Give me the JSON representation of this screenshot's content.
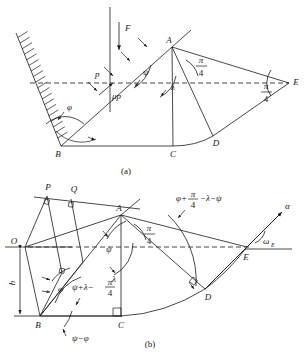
{
  "figure": {
    "title_note": "Two-panel geometric slip-line / wedge mechanism diagram",
    "captions": {
      "a": "(a)",
      "b": "(b)"
    }
  },
  "panel_a": {
    "points": [
      {
        "name": "A",
        "label": "A",
        "x": 172,
        "y": 47
      },
      {
        "name": "B",
        "label": "B",
        "x": 61,
        "y": 146
      },
      {
        "name": "C",
        "label": "C",
        "x": 173,
        "y": 146
      },
      {
        "name": "D",
        "label": "D",
        "x": 213,
        "y": 136
      },
      {
        "name": "E",
        "label": "E",
        "x": 289,
        "y": 83
      }
    ],
    "labels": {
      "force": "F",
      "pressure": "p",
      "friction": "μp",
      "wall_angle": "φ",
      "psi_angle": "ψ",
      "lambda_angle": "λ",
      "pi_over_4_num": "π",
      "pi_over_4_den": "4"
    }
  },
  "panel_b": {
    "points": [
      {
        "name": "P",
        "label": "P",
        "x": 48,
        "y": 191
      },
      {
        "name": "Q",
        "label": "Q",
        "x": 73,
        "y": 193
      },
      {
        "name": "O",
        "label": "O",
        "x": 13,
        "y": 244
      },
      {
        "name": "A",
        "label": "A",
        "x": 121,
        "y": 215
      },
      {
        "name": "B",
        "label": "B",
        "x": 40,
        "y": 318
      },
      {
        "name": "C",
        "label": "C",
        "x": 120,
        "y": 318
      },
      {
        "name": "D",
        "label": "D",
        "x": 205,
        "y": 291
      },
      {
        "name": "E",
        "label": "E",
        "x": 245,
        "y": 254
      }
    ],
    "labels": {
      "height": "h",
      "phi": "φ",
      "psi": "ψ",
      "lambda": "λ",
      "alpha": "α",
      "omega_E_base": "ω",
      "omega_E_sub": "E",
      "pi_over_4_num": "π",
      "pi_over_4_den": "4",
      "expr_left_a": "ψ+λ−",
      "expr_left_num": "π",
      "expr_left_den": "4",
      "expr_bottom": "ψ−φ",
      "expr_top_a": "φ+",
      "expr_top_num": "π",
      "expr_top_den": "4",
      "expr_top_b": "−λ−ψ"
    }
  },
  "colors": {
    "ink": "#1a1a1a",
    "background": "#ffffff"
  }
}
